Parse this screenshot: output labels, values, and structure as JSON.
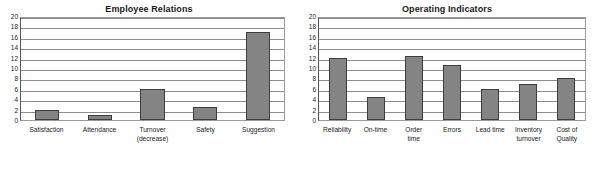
{
  "chart_data": [
    {
      "type": "bar",
      "title": "Employee Relations",
      "xlabel": "",
      "ylabel": "",
      "ylim": [
        0,
        20
      ],
      "ytick_step": 2,
      "yticks": [
        20,
        18,
        16,
        14,
        12,
        10,
        8,
        6,
        4,
        2,
        0
      ],
      "grid": true,
      "legend": "none",
      "bar_color": "#848484",
      "bar_edge_color": "#3d3d3d",
      "categories": [
        "Satisfaction",
        "Attendance",
        "Turnover\n(decrease)",
        "Safety",
        "Suggestion"
      ],
      "values": [
        2,
        1,
        6,
        2.5,
        17
      ]
    },
    {
      "type": "bar",
      "title": "Operating Indicators",
      "xlabel": "",
      "ylabel": "",
      "ylim": [
        0,
        20
      ],
      "ytick_step": 2,
      "yticks": [
        20,
        18,
        16,
        14,
        12,
        10,
        8,
        6,
        4,
        2,
        0
      ],
      "grid": true,
      "legend": "none",
      "bar_color": "#848484",
      "bar_edge_color": "#3d3d3d",
      "categories": [
        "Reliability",
        "On-time",
        "Order\ntime",
        "Errors",
        "Lead time",
        "Inventory\nturnover",
        "Cost of\nQuality"
      ],
      "values": [
        12,
        4.4,
        12.4,
        10.5,
        6,
        7,
        8
      ]
    }
  ]
}
